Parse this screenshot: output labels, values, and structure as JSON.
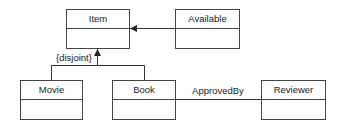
{
  "diagram": {
    "type": "uml-class-diagram",
    "classes": [
      {
        "id": "item",
        "name": "Item",
        "x": 66,
        "y": 9,
        "w": 63,
        "h": 39,
        "divider_y": 28
      },
      {
        "id": "available",
        "name": "Available",
        "x": 175,
        "y": 9,
        "w": 64,
        "h": 39,
        "divider_y": 28
      },
      {
        "id": "movie",
        "name": "Movie",
        "x": 20,
        "y": 80,
        "w": 62,
        "h": 39,
        "divider_y": 99
      },
      {
        "id": "book",
        "name": "Book",
        "x": 112,
        "y": 80,
        "w": 63,
        "h": 39,
        "divider_y": 99
      },
      {
        "id": "reviewer",
        "name": "Reviewer",
        "x": 261,
        "y": 80,
        "w": 64,
        "h": 39,
        "divider_y": 99
      }
    ],
    "relationships": [
      {
        "id": "available-to-item",
        "kind": "directed-association",
        "from": "Available",
        "to": "Item"
      },
      {
        "id": "generalization",
        "kind": "generalization",
        "parent": "Item",
        "children": [
          "Movie",
          "Book"
        ],
        "constraint": "{disjoint}"
      },
      {
        "id": "approved-by",
        "kind": "association",
        "from": "Book",
        "to": "Reviewer",
        "label": "ApprovedBy"
      }
    ],
    "colors": {
      "line": "#333333",
      "box_border": "#444444",
      "text": "#222222",
      "background": "#ffffff"
    }
  }
}
